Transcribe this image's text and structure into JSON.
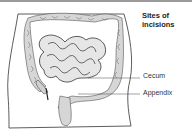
{
  "diagram": {
    "title_line1": "Sites of",
    "title_line2": "incisions",
    "labels": {
      "cecum": "Cecum",
      "appendix": "Appendix"
    },
    "colors": {
      "outline": "#333333",
      "intestine_fill": "#d8d8d8",
      "top_bar": "#9a9a9a"
    }
  }
}
